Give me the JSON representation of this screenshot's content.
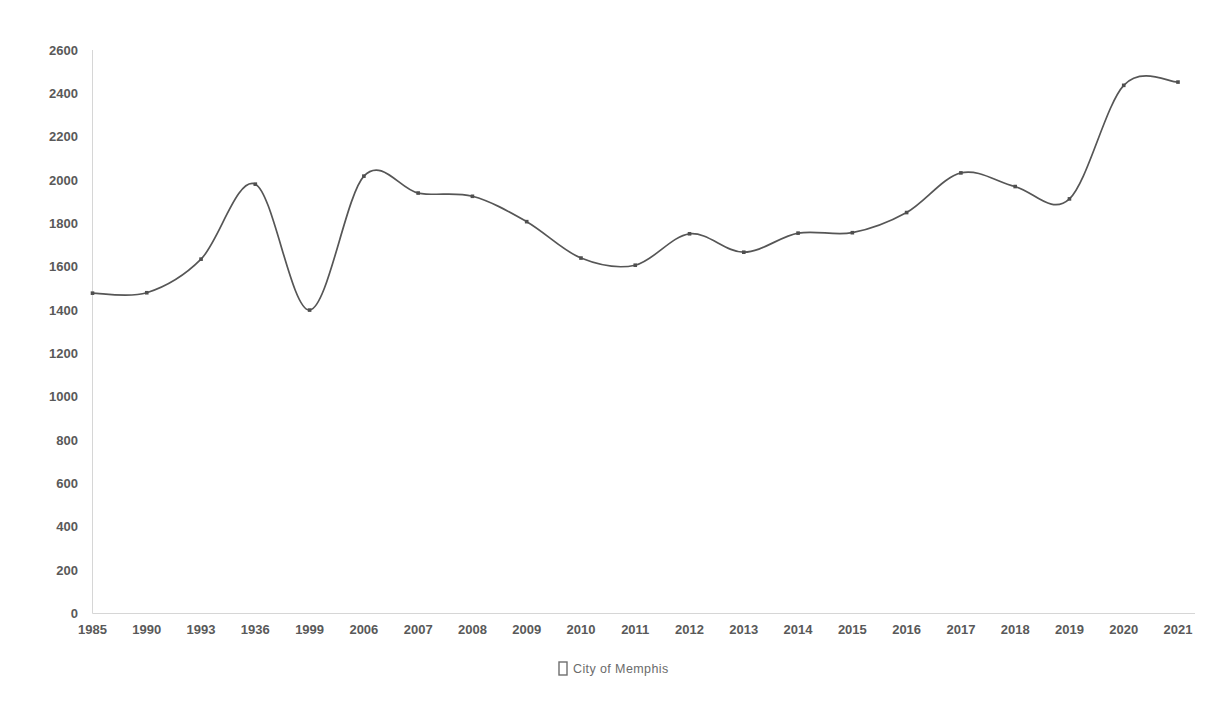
{
  "chart_data": {
    "type": "line",
    "title": "",
    "subtitle": "",
    "xlabel": "",
    "ylabel": "",
    "grid": false,
    "legend_position": "bottom-center",
    "categories": [
      "1985",
      "1990",
      "1993",
      "1936",
      "1999",
      "2006",
      "2007",
      "2008",
      "2009",
      "2010",
      "2011",
      "2012",
      "2013",
      "2014",
      "2015",
      "2016",
      "2017",
      "2018",
      "2019",
      "2020",
      "2021"
    ],
    "ylim": [
      0,
      2600
    ],
    "yticks": [
      0,
      200,
      400,
      600,
      800,
      1000,
      1200,
      1400,
      1600,
      1800,
      2000,
      2200,
      2400,
      2600
    ],
    "series": [
      {
        "name": "City of Memphis",
        "color": "#565656",
        "marker": "square",
        "smoothing": "spline",
        "values": [
          1478,
          1480,
          1635,
          1981,
          1400,
          2018,
          1940,
          1925,
          1808,
          1640,
          1607,
          1752,
          1667,
          1755,
          1757,
          1850,
          2033,
          1970,
          1913,
          2437,
          2452
        ]
      }
    ]
  },
  "legend": {
    "swatch_glyph": "missing-glyph-box",
    "entries": [
      {
        "label": "City of Memphis",
        "color": "#6e6e6e"
      }
    ]
  },
  "axes": {
    "y_axis_line_color": "#d6d6d6",
    "x_axis_line_color": "#d6d6d6",
    "tick_label_color": "#595959"
  }
}
